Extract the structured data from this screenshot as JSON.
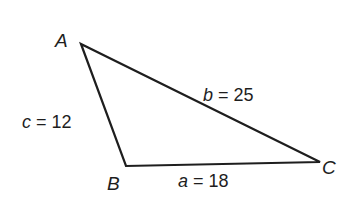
{
  "diagram": {
    "type": "triangle",
    "stroke_color": "#1e1e1e",
    "vertices": {
      "A": {
        "label": "A",
        "x": 81,
        "y": 44
      },
      "B": {
        "label": "B",
        "x": 126,
        "y": 166
      },
      "C": {
        "label": "C",
        "x": 320,
        "y": 162
      }
    },
    "sides": {
      "a": {
        "var": "a",
        "eq": " = ",
        "value": "18",
        "between": "B-C"
      },
      "b": {
        "var": "b",
        "eq": " = ",
        "value": "25",
        "between": "A-C"
      },
      "c": {
        "var": "c",
        "eq": " = ",
        "value": "12",
        "between": "A-B"
      }
    }
  }
}
